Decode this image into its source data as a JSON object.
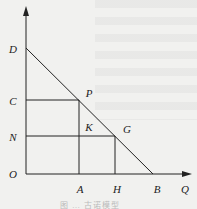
{
  "diagram": {
    "type": "economics-demand-diagram",
    "axes": {
      "x_label": "Q",
      "origin_label": "O"
    },
    "points": {
      "D": "D",
      "C": "C",
      "N": "N",
      "O": "O",
      "P": "P",
      "K": "K",
      "G": "G",
      "A": "A",
      "H": "H",
      "B": "B",
      "Q": "Q"
    },
    "lines": [
      {
        "name": "demand-line",
        "from": "D",
        "to": "B"
      },
      {
        "name": "horizontal-C-P",
        "from": "C",
        "to": "P"
      },
      {
        "name": "vertical-P-A",
        "from": "P",
        "to": "A"
      },
      {
        "name": "horizontal-N-G",
        "from": "N",
        "to": "G"
      },
      {
        "name": "vertical-G-H",
        "from": "G",
        "to": "H"
      }
    ],
    "colors": {
      "line": "#222222",
      "background": "#f1f1ef"
    },
    "caption": "图 … 古诺模型"
  }
}
